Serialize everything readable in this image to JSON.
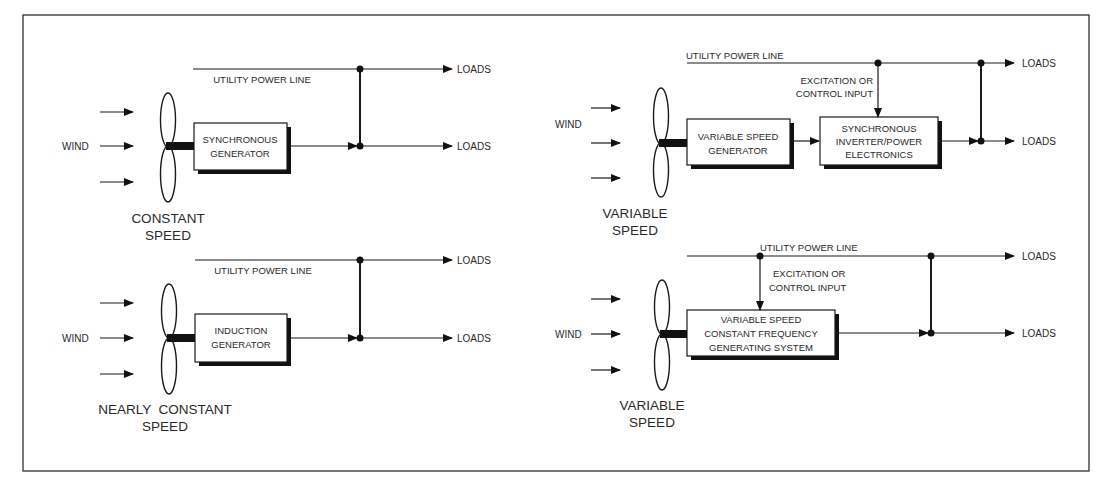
{
  "diagram": {
    "colors": {
      "line": "#1a1a1a",
      "background": "#ffffff",
      "frame": "#333333"
    },
    "panels": [
      {
        "id": "constant-speed",
        "wind_label": "WIND",
        "utility_label": "UTILITY POWER LINE",
        "generator_lines": [
          "SYNCHRONOUS",
          "GENERATOR"
        ],
        "speed_lines": [
          "CONSTANT",
          "SPEED"
        ],
        "loads": [
          "LOADS",
          "LOADS"
        ]
      },
      {
        "id": "nearly-constant-speed",
        "wind_label": "WIND",
        "utility_label": "UTILITY POWER LINE",
        "generator_lines": [
          "INDUCTION",
          "GENERATOR"
        ],
        "speed_lines": [
          "NEARLY  CONSTANT",
          "SPEED"
        ],
        "loads": [
          "LOADS",
          "LOADS"
        ]
      },
      {
        "id": "variable-speed-inverter",
        "wind_label": "WIND",
        "utility_label": "UTILITY POWER LINE",
        "excitation_lines": [
          "EXCITATION OR",
          "CONTROL INPUT"
        ],
        "generator_lines": [
          "VARIABLE SPEED",
          "GENERATOR"
        ],
        "inverter_lines": [
          "SYNCHRONOUS",
          "INVERTER/POWER",
          "ELECTRONICS"
        ],
        "speed_lines": [
          "VARIABLE",
          "SPEED"
        ],
        "loads": [
          "LOADS",
          "LOADS"
        ]
      },
      {
        "id": "variable-speed-constant-frequency",
        "wind_label": "WIND",
        "utility_label": "UTILITY POWER LINE",
        "excitation_lines": [
          "EXCITATION OR",
          "CONTROL INPUT"
        ],
        "generator_lines": [
          "VARIABLE SPEED",
          "CONSTANT FREQUENCY",
          "GENERATING SYSTEM"
        ],
        "speed_lines": [
          "VARIABLE",
          "SPEED"
        ],
        "loads": [
          "LOADS",
          "LOADS"
        ]
      }
    ]
  }
}
